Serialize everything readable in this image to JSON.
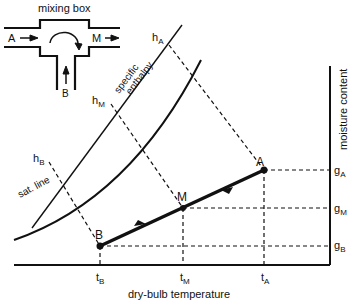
{
  "mixing_box": {
    "title": "mixing box",
    "inlet_a": "A",
    "inlet_b": "B",
    "outlet_m": "M"
  },
  "axes": {
    "x_label": "dry-bulb temperature",
    "y_label": "moisture content",
    "x_ticks": [
      {
        "main": "t",
        "sub": "B"
      },
      {
        "main": "t",
        "sub": "M"
      },
      {
        "main": "t",
        "sub": "A"
      }
    ],
    "y_ticks": [
      {
        "main": "g",
        "sub": "A"
      },
      {
        "main": "g",
        "sub": "M"
      },
      {
        "main": "g",
        "sub": "B"
      }
    ]
  },
  "curves": {
    "enthalpy_label_1": "specific",
    "enthalpy_label_2": "enthalpy",
    "saturation_label": "sat. line"
  },
  "enthalpy_ticks": [
    {
      "main": "h",
      "sub": "A"
    },
    {
      "main": "h",
      "sub": "M"
    },
    {
      "main": "h",
      "sub": "B"
    }
  ],
  "points": {
    "A": {
      "label": "A",
      "x": 264,
      "y": 170
    },
    "M": {
      "label": "M",
      "x": 183,
      "y": 208
    },
    "B": {
      "label": "B",
      "x": 100,
      "y": 246
    }
  },
  "colors": {
    "ink": "#111111",
    "background": "#ffffff"
  }
}
